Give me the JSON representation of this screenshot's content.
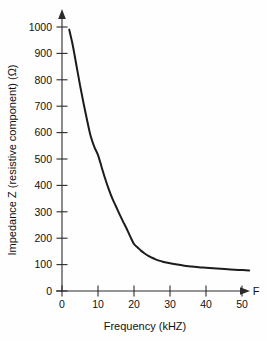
{
  "chart_data": {
    "type": "line",
    "title": "",
    "xlabel": "Frequency (kHZ)",
    "ylabel": "Impedance Z (resistive component) (Ω)",
    "x_axis_end_label": "F",
    "xlim": [
      0,
      55
    ],
    "ylim": [
      0,
      1060
    ],
    "xticks": [
      0,
      10,
      20,
      30,
      40,
      50
    ],
    "xtick_labels": [
      "0",
      "10",
      "20",
      "30",
      "40",
      "50"
    ],
    "yticks": [
      0,
      100,
      200,
      300,
      400,
      500,
      600,
      700,
      800,
      900,
      1000
    ],
    "ytick_labels": [
      "0",
      "100",
      "200",
      "300",
      "400",
      "500",
      "600",
      "700",
      "800",
      "900",
      "1000"
    ],
    "grid": false,
    "legend": null,
    "series": [
      {
        "name": "Impedance Z",
        "x": [
          2.0,
          3.0,
          4.0,
          5.0,
          6.0,
          7.0,
          8.0,
          9.0,
          10.0,
          11.0,
          12.0,
          13.0,
          14.0,
          15.0,
          16.0,
          17.0,
          18.0,
          19.0,
          20.0,
          21.0,
          22.0,
          23.0,
          24.0,
          25.0,
          26.0,
          27.0,
          28.0,
          29.0,
          30.0,
          32.0,
          34.0,
          36.0,
          38.0,
          40.0,
          43.0,
          46.0,
          49.0,
          52.0
        ],
        "y": [
          990,
          930,
          855,
          780,
          710,
          645,
          585,
          545,
          515,
          470,
          425,
          385,
          350,
          320,
          290,
          262,
          235,
          205,
          178,
          165,
          152,
          142,
          133,
          126,
          120,
          115,
          111,
          108,
          105,
          100,
          96,
          93,
          90,
          88,
          85,
          82,
          80,
          78
        ]
      }
    ],
    "units": {
      "x": "kHZ",
      "y": "Ω"
    }
  },
  "axes": {
    "y_arrow": true,
    "x_arrow": true
  }
}
